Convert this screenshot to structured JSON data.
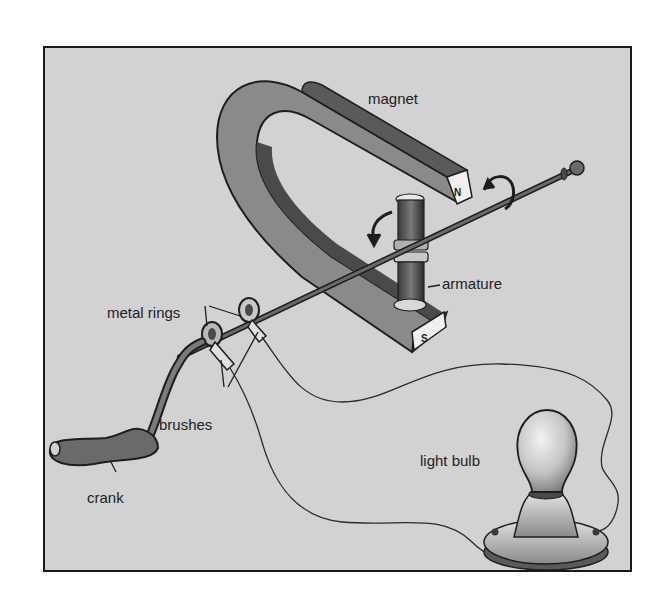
{
  "diagram": {
    "type": "hand-crank generator illustration",
    "labels": {
      "magnet": "magnet",
      "armature": "armature",
      "metal_rings": "metal rings",
      "brushes": "brushes",
      "crank": "crank",
      "light_bulb": "light bulb"
    },
    "pole_marks": {
      "north": "N",
      "south": "S"
    },
    "colors": {
      "background": "#d2d2d2",
      "frame": "#1a1a1a",
      "magnet_face": "#8a8a8a",
      "magnet_dark": "#4a4a4a",
      "ink": "#222222"
    }
  }
}
